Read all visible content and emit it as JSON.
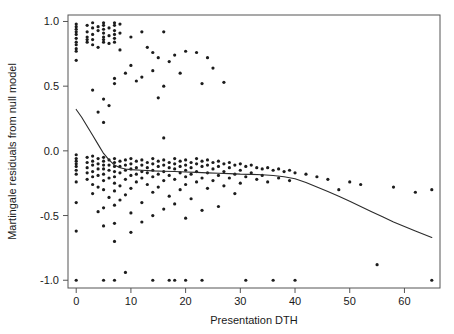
{
  "chart_data": {
    "type": "scatter",
    "title": "",
    "subtitle": "",
    "xlabel": "Presentation DTH",
    "ylabel": "Martingale residuals from null model",
    "xlim": [
      -1.5,
      66.5
    ],
    "ylim": [
      -1.06,
      1.05
    ],
    "xticks": [
      0,
      10,
      20,
      30,
      40,
      50,
      60
    ],
    "xticklabels": [
      "0",
      "10",
      "20",
      "30",
      "40",
      "50",
      "60"
    ],
    "yticks": [
      1.0,
      0.5,
      0.0,
      -0.5,
      -1.0
    ],
    "yticklabels": [
      "1.0",
      "0.5",
      "0.0",
      "-0.5",
      "-1.0"
    ],
    "grid": false,
    "legend": null,
    "frame": "box",
    "point_color": "#1c1c1c",
    "point_size": 1.6,
    "line_color": "#2b2b2b",
    "annotations": [],
    "series": [
      {
        "name": "Martingale residuals",
        "type": "scatter",
        "points": [
          [
            0,
            0.98
          ],
          [
            0,
            0.96
          ],
          [
            0,
            0.94
          ],
          [
            0,
            0.92
          ],
          [
            0,
            0.9
          ],
          [
            0,
            0.87
          ],
          [
            0,
            0.84
          ],
          [
            0,
            0.82
          ],
          [
            0,
            0.79
          ],
          [
            0,
            0.77
          ],
          [
            0,
            0.7
          ],
          [
            0,
            -0.03
          ],
          [
            0,
            -0.06
          ],
          [
            0,
            -0.08
          ],
          [
            0,
            -0.1
          ],
          [
            0,
            -0.12
          ],
          [
            0,
            -0.15
          ],
          [
            0,
            -0.18
          ],
          [
            0,
            -0.24
          ],
          [
            0,
            -0.4
          ],
          [
            0,
            -0.62
          ],
          [
            0,
            -1.0
          ],
          [
            2,
            0.97
          ],
          [
            2,
            0.92
          ],
          [
            2,
            0.88
          ],
          [
            2,
            0.86
          ],
          [
            2,
            0.84
          ],
          [
            2,
            -0.05
          ],
          [
            2,
            -0.09
          ],
          [
            2,
            -0.13
          ],
          [
            2,
            -0.17
          ],
          [
            2,
            -0.22
          ],
          [
            3,
            0.99
          ],
          [
            3,
            0.95
          ],
          [
            3,
            0.9
          ],
          [
            3,
            0.86
          ],
          [
            3,
            0.82
          ],
          [
            3,
            0.47
          ],
          [
            3,
            -0.04
          ],
          [
            3,
            -0.08
          ],
          [
            3,
            -0.11
          ],
          [
            3,
            -0.16
          ],
          [
            3,
            -0.2
          ],
          [
            3,
            -0.26
          ],
          [
            3,
            -0.33
          ],
          [
            4,
            0.96
          ],
          [
            4,
            0.93
          ],
          [
            4,
            0.8
          ],
          [
            4,
            0.3
          ],
          [
            4,
            -0.06
          ],
          [
            4,
            -0.1
          ],
          [
            4,
            -0.14
          ],
          [
            4,
            -0.19
          ],
          [
            4,
            -0.28
          ],
          [
            4,
            -0.47
          ],
          [
            5,
            0.99
          ],
          [
            5,
            0.97
          ],
          [
            5,
            0.94
          ],
          [
            5,
            0.91
          ],
          [
            5,
            0.88
          ],
          [
            5,
            0.86
          ],
          [
            5,
            0.84
          ],
          [
            5,
            0.4
          ],
          [
            5,
            0.22
          ],
          [
            5,
            -0.05
          ],
          [
            5,
            -0.08
          ],
          [
            5,
            -0.11
          ],
          [
            5,
            -0.14
          ],
          [
            5,
            -0.18
          ],
          [
            5,
            -0.23
          ],
          [
            5,
            -0.3
          ],
          [
            5,
            -0.44
          ],
          [
            5,
            -0.58
          ],
          [
            5,
            -1.0
          ],
          [
            6,
            0.95
          ],
          [
            6,
            0.89
          ],
          [
            6,
            0.83
          ],
          [
            6,
            0.35
          ],
          [
            6,
            -0.07
          ],
          [
            6,
            -0.11
          ],
          [
            6,
            -0.15
          ],
          [
            6,
            -0.21
          ],
          [
            6,
            -0.36
          ],
          [
            7,
            0.99
          ],
          [
            7,
            0.97
          ],
          [
            7,
            0.93
          ],
          [
            7,
            0.9
          ],
          [
            7,
            0.87
          ],
          [
            7,
            0.84
          ],
          [
            7,
            0.56
          ],
          [
            7,
            0.52
          ],
          [
            7,
            -0.06
          ],
          [
            7,
            -0.09
          ],
          [
            7,
            -0.12
          ],
          [
            7,
            -0.16
          ],
          [
            7,
            -0.2
          ],
          [
            7,
            -0.25
          ],
          [
            7,
            -0.31
          ],
          [
            7,
            -0.42
          ],
          [
            7,
            -0.56
          ],
          [
            7,
            -0.7
          ],
          [
            7,
            -1.0
          ],
          [
            8,
            0.98
          ],
          [
            8,
            0.91
          ],
          [
            8,
            0.78
          ],
          [
            8,
            -0.08
          ],
          [
            8,
            -0.12
          ],
          [
            8,
            -0.17
          ],
          [
            8,
            -0.27
          ],
          [
            8,
            -0.38
          ],
          [
            9,
            0.6
          ],
          [
            9,
            -0.07
          ],
          [
            9,
            -0.11
          ],
          [
            9,
            -0.15
          ],
          [
            9,
            -0.22
          ],
          [
            9,
            -0.34
          ],
          [
            9,
            -0.94
          ],
          [
            10,
            0.88
          ],
          [
            10,
            0.66
          ],
          [
            10,
            -0.06
          ],
          [
            10,
            -0.1
          ],
          [
            10,
            -0.14
          ],
          [
            10,
            -0.19
          ],
          [
            10,
            -0.29
          ],
          [
            10,
            -0.48
          ],
          [
            10,
            -0.63
          ],
          [
            11,
            0.54
          ],
          [
            11,
            -0.08
          ],
          [
            11,
            -0.13
          ],
          [
            11,
            -0.18
          ],
          [
            11,
            -0.24
          ],
          [
            12,
            0.92
          ],
          [
            12,
            0.57
          ],
          [
            12,
            -0.07
          ],
          [
            12,
            -0.11
          ],
          [
            12,
            -0.16
          ],
          [
            12,
            -0.21
          ],
          [
            12,
            -0.4
          ],
          [
            12,
            -0.55
          ],
          [
            13,
            0.8
          ],
          [
            13,
            -0.09
          ],
          [
            13,
            -0.13
          ],
          [
            13,
            -0.17
          ],
          [
            13,
            -0.26
          ],
          [
            14,
            0.76
          ],
          [
            14,
            0.62
          ],
          [
            14,
            -0.06
          ],
          [
            14,
            -0.1
          ],
          [
            14,
            -0.15
          ],
          [
            14,
            -0.2
          ],
          [
            14,
            -0.32
          ],
          [
            14,
            -0.5
          ],
          [
            14,
            -1.0
          ],
          [
            15,
            0.72
          ],
          [
            15,
            0.41
          ],
          [
            15,
            -0.08
          ],
          [
            15,
            -0.12
          ],
          [
            15,
            -0.18
          ],
          [
            15,
            -0.28
          ],
          [
            16,
            0.92
          ],
          [
            16,
            0.5
          ],
          [
            16,
            0.1
          ],
          [
            16,
            -0.07
          ],
          [
            16,
            -0.11
          ],
          [
            16,
            -0.16
          ],
          [
            16,
            -0.23
          ],
          [
            16,
            -0.45
          ],
          [
            17,
            0.69
          ],
          [
            17,
            -0.09
          ],
          [
            17,
            -0.13
          ],
          [
            17,
            -0.19
          ],
          [
            17,
            -0.35
          ],
          [
            17,
            -1.0
          ],
          [
            18,
            0.74
          ],
          [
            18,
            -0.06
          ],
          [
            18,
            -0.1
          ],
          [
            18,
            -0.14
          ],
          [
            18,
            -0.22
          ],
          [
            18,
            -0.41
          ],
          [
            18,
            -1.0
          ],
          [
            19,
            0.6
          ],
          [
            19,
            -0.08
          ],
          [
            19,
            -0.12
          ],
          [
            19,
            -0.17
          ],
          [
            19,
            -0.3
          ],
          [
            20,
            0.77
          ],
          [
            20,
            -0.07
          ],
          [
            20,
            -0.11
          ],
          [
            20,
            -0.15
          ],
          [
            20,
            -0.2
          ],
          [
            20,
            -0.26
          ],
          [
            20,
            -0.52
          ],
          [
            20,
            -1.0
          ],
          [
            21,
            -0.09
          ],
          [
            21,
            -0.13
          ],
          [
            21,
            -0.18
          ],
          [
            21,
            -0.37
          ],
          [
            22,
            0.76
          ],
          [
            22,
            -0.06
          ],
          [
            22,
            -0.1
          ],
          [
            22,
            -0.16
          ],
          [
            22,
            -0.24
          ],
          [
            23,
            0.52
          ],
          [
            23,
            -0.08
          ],
          [
            23,
            -0.12
          ],
          [
            23,
            -0.21
          ],
          [
            23,
            -0.46
          ],
          [
            23,
            -1.0
          ],
          [
            24,
            0.72
          ],
          [
            24,
            -0.07
          ],
          [
            24,
            -0.11
          ],
          [
            24,
            -0.17
          ],
          [
            24,
            -0.29
          ],
          [
            25,
            0.64
          ],
          [
            25,
            -0.09
          ],
          [
            25,
            -0.14
          ],
          [
            25,
            -0.23
          ],
          [
            26,
            -0.08
          ],
          [
            26,
            -0.12
          ],
          [
            26,
            -0.19
          ],
          [
            26,
            -0.43
          ],
          [
            27,
            0.53
          ],
          [
            27,
            -0.1
          ],
          [
            27,
            -0.16
          ],
          [
            27,
            -0.27
          ],
          [
            28,
            -0.09
          ],
          [
            28,
            -0.13
          ],
          [
            28,
            -0.21
          ],
          [
            29,
            -0.11
          ],
          [
            29,
            -0.18
          ],
          [
            29,
            -0.33
          ],
          [
            30,
            -0.1
          ],
          [
            30,
            -0.15
          ],
          [
            30,
            -0.25
          ],
          [
            31,
            -0.12
          ],
          [
            31,
            -0.2
          ],
          [
            31,
            -1.0
          ],
          [
            32,
            -0.11
          ],
          [
            32,
            -0.17
          ],
          [
            33,
            -0.13
          ],
          [
            33,
            -0.22
          ],
          [
            34,
            -0.14
          ],
          [
            34,
            -0.19
          ],
          [
            35,
            -0.13
          ],
          [
            35,
            -0.24
          ],
          [
            36,
            -0.15
          ],
          [
            36,
            -1.0
          ],
          [
            37,
            -0.14
          ],
          [
            37,
            -0.21
          ],
          [
            38,
            -0.16
          ],
          [
            39,
            -0.15
          ],
          [
            39,
            -0.23
          ],
          [
            40,
            -0.17
          ],
          [
            40,
            -1.0
          ],
          [
            42,
            -0.18
          ],
          [
            44,
            -0.2
          ],
          [
            46,
            -0.22
          ],
          [
            48,
            -0.3
          ],
          [
            50,
            -0.24
          ],
          [
            52,
            -0.26
          ],
          [
            55,
            -0.88
          ],
          [
            58,
            -0.28
          ],
          [
            62,
            -0.32
          ],
          [
            65,
            -0.3
          ],
          [
            65,
            -1.0
          ]
        ]
      },
      {
        "name": "Smoothed trend",
        "type": "line",
        "points": [
          [
            0,
            0.32
          ],
          [
            1,
            0.26
          ],
          [
            2,
            0.19
          ],
          [
            3,
            0.12
          ],
          [
            4,
            0.05
          ],
          [
            5,
            -0.02
          ],
          [
            6,
            -0.07
          ],
          [
            7,
            -0.11
          ],
          [
            8,
            -0.13
          ],
          [
            9,
            -0.14
          ],
          [
            10,
            -0.145
          ],
          [
            12,
            -0.15
          ],
          [
            14,
            -0.155
          ],
          [
            16,
            -0.158
          ],
          [
            18,
            -0.16
          ],
          [
            20,
            -0.163
          ],
          [
            22,
            -0.166
          ],
          [
            24,
            -0.17
          ],
          [
            26,
            -0.173
          ],
          [
            28,
            -0.176
          ],
          [
            30,
            -0.18
          ],
          [
            32,
            -0.182
          ],
          [
            34,
            -0.185
          ],
          [
            36,
            -0.19
          ],
          [
            38,
            -0.2
          ],
          [
            40,
            -0.215
          ],
          [
            42,
            -0.245
          ],
          [
            44,
            -0.28
          ],
          [
            46,
            -0.315
          ],
          [
            48,
            -0.35
          ],
          [
            50,
            -0.39
          ],
          [
            52,
            -0.43
          ],
          [
            54,
            -0.47
          ],
          [
            56,
            -0.51
          ],
          [
            58,
            -0.55
          ],
          [
            60,
            -0.585
          ],
          [
            62,
            -0.62
          ],
          [
            65,
            -0.67
          ]
        ]
      }
    ]
  }
}
